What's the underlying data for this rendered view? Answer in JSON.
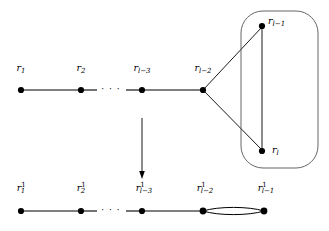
{
  "figure": {
    "type": "graph-contraction-diagram",
    "caption": "",
    "background_color": "#ffffff",
    "stroke_color": "#000000",
    "node_color": "#000000"
  },
  "top_graph": {
    "name": "original-graph",
    "path_labels": {
      "r1": {
        "base": "r",
        "sub": "1",
        "sup": ""
      },
      "r2": {
        "base": "r",
        "sub": "2",
        "sup": ""
      },
      "rl3": {
        "base": "r",
        "sub": "l−3",
        "sup": ""
      },
      "rl2": {
        "base": "r",
        "sub": "l−2",
        "sup": ""
      },
      "rl1": {
        "base": "r",
        "sub": "l−1",
        "sup": ""
      },
      "rl": {
        "base": "r",
        "sub": "l",
        "sup": ""
      }
    },
    "ellipsis": "· · ·",
    "nodes": [
      {
        "id": "r1",
        "x": 21,
        "y": 90,
        "label": "r1"
      },
      {
        "id": "r2",
        "x": 81,
        "y": 90,
        "label": "r2"
      },
      {
        "id": "rl3",
        "x": 142,
        "y": 90,
        "label": "rl3"
      },
      {
        "id": "rl2",
        "x": 203,
        "y": 90,
        "label": "rl2"
      },
      {
        "id": "rl1",
        "x": 262,
        "y": 26,
        "label": "rl1"
      },
      {
        "id": "rl",
        "x": 262,
        "y": 151,
        "label": "rl"
      }
    ],
    "edges": [
      {
        "from": "r1",
        "to": "r2",
        "style": "solid"
      },
      {
        "from": "rl3",
        "to": "rl2",
        "style": "solid"
      },
      {
        "from": "rl2",
        "to": "rl1",
        "style": "solid"
      },
      {
        "from": "rl2",
        "to": "rl",
        "style": "solid"
      },
      {
        "from": "rl1",
        "to": "rl",
        "style": "solid"
      }
    ],
    "grouping_box": {
      "name": "contracted-subgraph-box",
      "shape": "rounded-rectangle",
      "x": 241,
      "y": 11,
      "width": 77,
      "height": 157,
      "corner_radius": 22
    }
  },
  "contraction_arrow": {
    "name": "contraction-arrow",
    "direction": "down",
    "x": 142,
    "y_start": 118,
    "y_end": 178
  },
  "bottom_graph": {
    "name": "contracted-graph",
    "path_labels": {
      "r1": {
        "base": "r",
        "sub": "1",
        "sup": "1"
      },
      "r2": {
        "base": "r",
        "sub": "2",
        "sup": "1"
      },
      "rl3": {
        "base": "r",
        "sub": "l−3",
        "sup": "1"
      },
      "rl2": {
        "base": "r",
        "sub": "l−2",
        "sup": "1"
      },
      "rl1": {
        "base": "r",
        "sub": "l−1",
        "sup": "1"
      }
    },
    "ellipsis": "· · ·",
    "nodes": [
      {
        "id": "r1",
        "x": 21,
        "y": 211,
        "label": "r1"
      },
      {
        "id": "r2",
        "x": 81,
        "y": 211,
        "label": "r2"
      },
      {
        "id": "rl3",
        "x": 142,
        "y": 211,
        "label": "rl3"
      },
      {
        "id": "rl2",
        "x": 203,
        "y": 211,
        "label": "rl2"
      },
      {
        "id": "rl1",
        "x": 264,
        "y": 211,
        "label": "rl1"
      }
    ],
    "edges": [
      {
        "from": "r1",
        "to": "r2",
        "style": "solid"
      },
      {
        "from": "rl3",
        "to": "rl2",
        "style": "solid"
      },
      {
        "from": "rl2",
        "to": "rl1",
        "style": "double"
      }
    ]
  }
}
